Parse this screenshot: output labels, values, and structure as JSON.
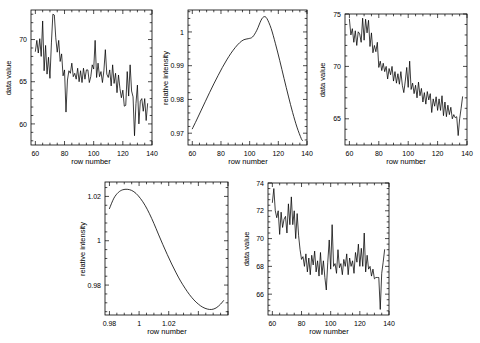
{
  "figure": {
    "background": "#ffffff",
    "line_color": "#000000",
    "panel_count": 5,
    "layout": "3 panels top row, 2 panels bottom row"
  },
  "chart_data": [
    {
      "id": "panel-1",
      "type": "line",
      "title": "",
      "xlabel": "row number",
      "ylabel": "data value",
      "xlim": [
        57,
        140
      ],
      "ylim": [
        57.5,
        73.5
      ],
      "xticks": [
        60,
        80,
        100,
        120,
        140
      ],
      "yticks": [
        60,
        65,
        70
      ],
      "xticklabels": [
        "60",
        "80",
        "100",
        "120",
        "140"
      ],
      "yticklabels": [
        "60",
        "65",
        "70"
      ],
      "grid": false,
      "legend": null,
      "x": [
        60,
        61,
        62,
        63,
        64,
        65,
        66,
        67,
        68,
        69,
        70,
        71,
        72,
        73,
        74,
        75,
        76,
        77,
        78,
        79,
        80,
        81,
        82,
        83,
        84,
        85,
        86,
        87,
        88,
        89,
        90,
        91,
        92,
        93,
        94,
        95,
        96,
        97,
        98,
        99,
        100,
        101,
        102,
        103,
        104,
        105,
        106,
        107,
        108,
        109,
        110,
        111,
        112,
        113,
        114,
        115,
        116,
        117,
        118,
        119,
        120,
        121,
        122,
        123,
        124,
        125,
        126,
        127,
        128,
        129,
        130,
        131,
        132,
        133,
        134,
        135,
        136,
        137
      ],
      "values": [
        68.6,
        69.9,
        68.4,
        70.1,
        68.0,
        72.2,
        66.3,
        69.3,
        65.9,
        67.9,
        65.4,
        69.6,
        73.0,
        72.9,
        70.2,
        68.5,
        69.9,
        67.4,
        68.3,
        65.7,
        66.4,
        61.4,
        65.2,
        66.3,
        66.0,
        67.2,
        65.6,
        66.0,
        65.3,
        66.6,
        65.0,
        66.3,
        64.9,
        66.6,
        65.3,
        66.4,
        66.4,
        64.9,
        65.6,
        67.0,
        66.5,
        69.9,
        65.5,
        67.2,
        65.6,
        66.2,
        64.9,
        66.3,
        68.8,
        65.9,
        65.5,
        66.4,
        64.5,
        67.0,
        64.8,
        66.0,
        63.7,
        65.8,
        64.2,
        63.1,
        64.0,
        62.1,
        62.2,
        66.2,
        63.3,
        67.0,
        63.9,
        63.2,
        58.6,
        62.4,
        64.6,
        60.0,
        62.7,
        63.0,
        61.5,
        63.0,
        60.4,
        62.4
      ]
    },
    {
      "id": "panel-2",
      "type": "line",
      "title": "",
      "xlabel": "row number",
      "ylabel": "relative intensity",
      "xlim": [
        57,
        140
      ],
      "ylim": [
        0.9665,
        1.0065
      ],
      "xticks": [
        60,
        80,
        100,
        120,
        140
      ],
      "yticks": [
        0.97,
        0.98,
        0.99,
        1.0
      ],
      "xticklabels": [
        "60",
        "80",
        "100",
        "120",
        "140"
      ],
      "yticklabels": [
        "0.97",
        "0.98",
        "0.99",
        "1"
      ],
      "grid": false,
      "legend": null,
      "x": [
        60,
        63,
        66,
        69,
        72,
        75,
        78,
        81,
        84,
        87,
        90,
        93,
        96,
        99,
        102,
        105,
        108,
        110,
        112,
        115,
        118,
        121,
        124,
        127,
        130,
        133,
        136,
        137
      ],
      "values": [
        0.9713,
        0.9739,
        0.9766,
        0.9793,
        0.982,
        0.9846,
        0.9871,
        0.9895,
        0.9917,
        0.9937,
        0.9954,
        0.9968,
        0.9977,
        0.998,
        0.9985,
        1.0005,
        1.0035,
        1.0045,
        1.004,
        1.001,
        0.9965,
        0.9915,
        0.9862,
        0.981,
        0.9761,
        0.9718,
        0.9684,
        0.9678
      ]
    },
    {
      "id": "panel-3",
      "type": "line",
      "title": "",
      "xlabel": "row number",
      "ylabel": "data value",
      "xlim": [
        57,
        140
      ],
      "ylim": [
        62.5,
        75
      ],
      "xticks": [
        60,
        80,
        100,
        120,
        140
      ],
      "yticks": [
        65,
        70,
        75
      ],
      "xticklabels": [
        "60",
        "80",
        "100",
        "120",
        "140"
      ],
      "yticklabels": [
        "65",
        "70",
        "75"
      ],
      "grid": false,
      "legend": null,
      "x": [
        60,
        61,
        62,
        63,
        64,
        65,
        66,
        67,
        68,
        69,
        70,
        71,
        72,
        73,
        74,
        75,
        76,
        77,
        78,
        79,
        80,
        81,
        82,
        83,
        84,
        85,
        86,
        87,
        88,
        89,
        90,
        91,
        92,
        93,
        94,
        95,
        96,
        97,
        98,
        99,
        100,
        101,
        102,
        103,
        104,
        105,
        106,
        107,
        108,
        109,
        110,
        111,
        112,
        113,
        114,
        115,
        116,
        117,
        118,
        119,
        120,
        121,
        122,
        123,
        124,
        125,
        126,
        127,
        128,
        129,
        130,
        131,
        132,
        133,
        134,
        135,
        136,
        137
      ],
      "values": [
        74.5,
        73.0,
        73.6,
        72.3,
        73.4,
        72.0,
        73.3,
        73.1,
        72.3,
        74.6,
        72.5,
        74.5,
        73.2,
        74.4,
        71.9,
        73.2,
        71.3,
        72.0,
        71.4,
        72.3,
        69.9,
        70.5,
        69.6,
        70.3,
        69.5,
        70.0,
        68.8,
        69.8,
        69.2,
        70.0,
        68.6,
        69.5,
        68.4,
        69.3,
        68.3,
        69.5,
        68.2,
        67.5,
        68.6,
        69.9,
        68.0,
        70.5,
        67.8,
        68.4,
        67.4,
        68.2,
        67.0,
        68.5,
        67.2,
        67.9,
        66.6,
        67.5,
        66.4,
        67.6,
        66.8,
        67.4,
        65.6,
        66.9,
        66.2,
        67.1,
        65.8,
        66.9,
        65.8,
        67.2,
        65.3,
        66.6,
        65.2,
        66.3,
        65.4,
        66.1,
        65.0,
        65.4,
        65.1,
        65.2,
        63.4,
        65.0,
        66.0,
        67.1
      ]
    },
    {
      "id": "panel-4",
      "type": "line",
      "title": "",
      "xlabel": "row number",
      "ylabel": "relative intensity",
      "xlim": [
        57,
        140
      ],
      "ylim": [
        0.9665,
        1.0265
      ],
      "xticks": [
        60,
        80,
        100,
        120,
        140
      ],
      "yticks": [
        0.98,
        1.0,
        1.02
      ],
      "xticklabels": [
        "0.98",
        "1",
        "1.02"
      ],
      "yticklabels": [
        "0.98",
        "1",
        "1.02"
      ],
      "grid": false,
      "legend": null,
      "x": [
        60,
        63,
        66,
        69,
        72,
        75,
        78,
        81,
        84,
        87,
        90,
        93,
        96,
        99,
        102,
        105,
        108,
        111,
        114,
        117,
        120,
        123,
        126,
        129,
        132,
        135,
        137
      ],
      "values": [
        1.0145,
        1.0192,
        1.0218,
        1.023,
        1.0232,
        1.0227,
        1.0213,
        1.019,
        1.016,
        1.0122,
        1.0078,
        1.003,
        0.9983,
        0.9938,
        0.9895,
        0.9855,
        0.9818,
        0.9786,
        0.9757,
        0.9733,
        0.9714,
        0.97,
        0.9692,
        0.969,
        0.9697,
        0.9714,
        0.973
      ]
    },
    {
      "id": "panel-5",
      "type": "line",
      "title": "",
      "xlabel": "row number",
      "ylabel": "data value",
      "xlim": [
        57,
        140
      ],
      "ylim": [
        64.5,
        74
      ],
      "xticks": [
        60,
        80,
        100,
        120,
        140
      ],
      "yticks": [
        66,
        68,
        70,
        72,
        74
      ],
      "xticklabels": [
        "60",
        "80",
        "100",
        "120",
        "140"
      ],
      "yticklabels": [
        "66",
        "68",
        "70",
        "72",
        "74"
      ],
      "grid": false,
      "legend": null,
      "x": [
        60,
        61,
        62,
        63,
        64,
        65,
        66,
        67,
        68,
        69,
        70,
        71,
        72,
        73,
        74,
        75,
        76,
        77,
        78,
        79,
        80,
        81,
        82,
        83,
        84,
        85,
        86,
        87,
        88,
        89,
        90,
        91,
        92,
        93,
        94,
        95,
        96,
        97,
        98,
        99,
        100,
        101,
        102,
        103,
        104,
        105,
        106,
        107,
        108,
        109,
        110,
        111,
        112,
        113,
        114,
        115,
        116,
        117,
        118,
        119,
        120,
        121,
        122,
        123,
        124,
        125,
        126,
        127,
        128,
        129,
        130,
        131,
        132,
        133,
        134,
        135,
        136,
        137
      ],
      "values": [
        72.6,
        73.6,
        72.0,
        71.5,
        72.0,
        70.3,
        71.9,
        70.8,
        71.4,
        71.6,
        70.4,
        72.5,
        71.0,
        73.0,
        71.0,
        72.0,
        70.0,
        71.8,
        70.2,
        69.2,
        68.5,
        68.7,
        68.0,
        68.9,
        67.6,
        68.6,
        67.4,
        68.8,
        68.1,
        69.1,
        67.6,
        68.4,
        67.3,
        69.0,
        67.4,
        68.4,
        67.2,
        66.3,
        68.3,
        69.9,
        67.8,
        71.0,
        68.0,
        68.2,
        67.5,
        69.2,
        67.9,
        68.2,
        67.4,
        68.5,
        68.0,
        68.9,
        67.4,
        68.6,
        68.0,
        68.4,
        67.5,
        69.0,
        68.3,
        69.6,
        68.0,
        69.3,
        68.0,
        70.4,
        67.6,
        68.8,
        67.8,
        68.0,
        67.3,
        67.8,
        67.1,
        67.2,
        67.2,
        67.2,
        64.9,
        67.5,
        68.3,
        69.2
      ]
    }
  ]
}
